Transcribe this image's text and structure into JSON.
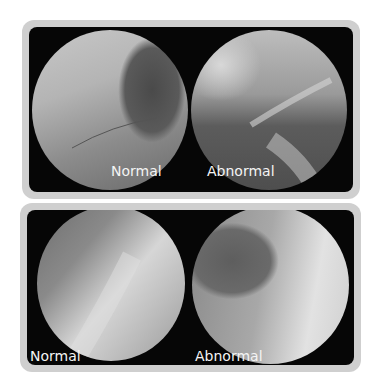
{
  "panels": [
    {
      "name": "top",
      "images": [
        {
          "label": "Normal",
          "description": "Fluoroscopy lateral neck view, normal swallow"
        },
        {
          "label": "Abnormal",
          "description": "Fluoroscopy lateral neck view, abnormal swallow"
        }
      ]
    },
    {
      "name": "bottom",
      "images": [
        {
          "label": "Normal",
          "description": "Fluoroscopy lateral neck view, normal swallow"
        },
        {
          "label": "Abnormal",
          "description": "Fluoroscopy lateral neck view, abnormal swallow"
        }
      ]
    }
  ],
  "colors": {
    "frame": "#cfcfcf",
    "background": "#060606",
    "label": "#f4f4f4"
  }
}
